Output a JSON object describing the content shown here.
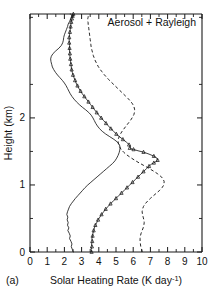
{
  "figure": {
    "panel_label": "(a)",
    "annotation": "Aerosol + Rayleigh"
  },
  "chart_data": {
    "type": "line",
    "title": "",
    "annotation": "Aerosol + Rayleigh",
    "panel_label": "(a)",
    "xlabel": "Solar Heating Rate (K day⁻¹)",
    "ylabel": "Height (km)",
    "xlim": [
      0,
      10
    ],
    "ylim": [
      0,
      3.55
    ],
    "grid": false,
    "legend_position": "none",
    "x_major_ticks": [
      0,
      1,
      2,
      3,
      4,
      5,
      6,
      7,
      8,
      9,
      10
    ],
    "x_major_tick_labels": [
      "0",
      "1",
      "2",
      "3",
      "4",
      "5",
      "6",
      "7",
      "8",
      "9",
      "10"
    ],
    "x_minor_tick_step": 0.5,
    "y_major_ticks": [
      0,
      1,
      2
    ],
    "y_major_tick_labels": [
      "0",
      "1",
      "2"
    ],
    "y_minor_tick_step": 0.5,
    "series": [
      {
        "name": "solid-thin",
        "style": "solid",
        "marker": "none",
        "x": [
          2.52,
          2.46,
          2.4,
          2.44,
          2.38,
          2.3,
          2.34,
          2.28,
          2.2,
          2.26,
          2.18,
          2.22,
          2.16,
          2.2,
          2.14,
          2.18,
          2.24,
          2.3,
          2.4,
          2.52,
          2.64,
          2.78,
          2.92,
          3.06,
          3.2,
          3.36,
          3.54,
          3.72,
          3.9,
          4.08,
          4.26,
          4.44,
          4.62,
          4.8,
          4.94,
          5.04,
          5.12,
          5.18,
          5.22,
          5.24,
          5.2,
          5.08,
          4.88,
          4.64,
          4.4,
          4.2,
          4.04,
          3.92,
          3.82,
          3.74,
          3.66,
          3.56,
          3.42,
          3.24,
          3.04,
          2.86,
          2.7,
          2.56,
          2.44,
          2.34,
          2.26,
          2.18,
          2.1,
          2.0,
          1.88,
          1.74,
          1.6,
          1.48,
          1.38,
          1.3,
          1.26,
          1.22,
          1.2,
          1.24,
          1.34,
          1.5,
          1.68,
          1.82,
          1.9,
          1.94,
          1.96,
          2.0,
          2.06,
          2.12,
          2.18,
          2.22,
          2.26,
          2.3,
          2.34,
          2.36,
          2.38,
          2.4,
          2.42,
          2.44,
          2.42,
          2.4,
          2.38,
          2.36,
          2.34
        ],
        "y": [
          0.0,
          0.04,
          0.08,
          0.12,
          0.16,
          0.2,
          0.24,
          0.28,
          0.32,
          0.36,
          0.4,
          0.44,
          0.48,
          0.52,
          0.56,
          0.6,
          0.64,
          0.68,
          0.72,
          0.76,
          0.8,
          0.84,
          0.88,
          0.92,
          0.96,
          1.0,
          1.04,
          1.08,
          1.12,
          1.16,
          1.2,
          1.24,
          1.28,
          1.32,
          1.36,
          1.4,
          1.44,
          1.48,
          1.52,
          1.56,
          1.6,
          1.64,
          1.68,
          1.72,
          1.76,
          1.8,
          1.84,
          1.88,
          1.92,
          1.96,
          2.0,
          2.04,
          2.08,
          2.12,
          2.16,
          2.2,
          2.24,
          2.28,
          2.32,
          2.36,
          2.4,
          2.44,
          2.48,
          2.52,
          2.56,
          2.6,
          2.64,
          2.68,
          2.72,
          2.76,
          2.8,
          2.84,
          2.88,
          2.92,
          2.96,
          3.0,
          3.04,
          3.08,
          3.12,
          3.16,
          3.2,
          3.24,
          3.28,
          3.32,
          3.36,
          3.4,
          3.42,
          3.44,
          3.46,
          3.48,
          3.49,
          3.5,
          3.51,
          3.52,
          3.53,
          3.54,
          3.545,
          3.55,
          3.55
        ]
      },
      {
        "name": "triangle-marked",
        "style": "solid",
        "marker": "triangle",
        "x": [
          3.58,
          3.56,
          3.6,
          3.58,
          3.62,
          3.6,
          3.64,
          3.66,
          3.7,
          3.74,
          3.8,
          3.88,
          3.96,
          4.06,
          4.16,
          4.28,
          4.4,
          4.54,
          4.68,
          4.84,
          5.0,
          5.16,
          5.32,
          5.48,
          5.64,
          5.8,
          5.96,
          6.12,
          6.28,
          6.44,
          6.6,
          6.76,
          6.92,
          7.06,
          7.2,
          7.34,
          7.42,
          7.38,
          7.2,
          6.92,
          6.6,
          6.28,
          6.02,
          5.86,
          5.8,
          5.84,
          5.76,
          5.6,
          5.4,
          5.2,
          5.02,
          4.86,
          4.7,
          4.56,
          4.42,
          4.28,
          4.14,
          4.0,
          3.88,
          3.76,
          3.64,
          3.52,
          3.4,
          3.28,
          3.16,
          3.04,
          2.94,
          2.84,
          2.76,
          2.68,
          2.62,
          2.56,
          2.5,
          2.46,
          2.42,
          2.4,
          2.38,
          2.36,
          2.34,
          2.32,
          2.32,
          2.3,
          2.3,
          2.3,
          2.28,
          2.28,
          2.28,
          2.3,
          2.32,
          2.34,
          2.36,
          2.38,
          2.4,
          2.42,
          2.44,
          2.46,
          2.48,
          2.5,
          2.52
        ],
        "y": [
          0.0,
          0.04,
          0.08,
          0.12,
          0.16,
          0.2,
          0.24,
          0.28,
          0.32,
          0.36,
          0.4,
          0.44,
          0.48,
          0.52,
          0.56,
          0.6,
          0.64,
          0.68,
          0.72,
          0.76,
          0.8,
          0.84,
          0.88,
          0.92,
          0.96,
          1.0,
          1.04,
          1.08,
          1.12,
          1.16,
          1.2,
          1.24,
          1.28,
          1.31,
          1.33,
          1.35,
          1.37,
          1.4,
          1.43,
          1.46,
          1.49,
          1.51,
          1.53,
          1.54,
          1.55,
          1.57,
          1.6,
          1.64,
          1.68,
          1.72,
          1.76,
          1.8,
          1.84,
          1.88,
          1.92,
          1.96,
          2.0,
          2.04,
          2.08,
          2.12,
          2.16,
          2.2,
          2.24,
          2.28,
          2.32,
          2.36,
          2.4,
          2.44,
          2.48,
          2.52,
          2.56,
          2.6,
          2.64,
          2.68,
          2.72,
          2.76,
          2.8,
          2.84,
          2.88,
          2.92,
          2.96,
          3.0,
          3.04,
          3.08,
          3.12,
          3.16,
          3.2,
          3.24,
          3.28,
          3.32,
          3.36,
          3.4,
          3.43,
          3.46,
          3.48,
          3.5,
          3.52,
          3.54,
          3.55
        ]
      },
      {
        "name": "dashed",
        "style": "dashed",
        "marker": "none",
        "x": [
          6.52,
          6.48,
          6.44,
          6.42,
          6.4,
          6.4,
          6.42,
          6.46,
          6.52,
          6.58,
          6.62,
          6.64,
          6.62,
          6.58,
          6.54,
          6.52,
          6.54,
          6.6,
          6.7,
          6.84,
          7.0,
          7.18,
          7.36,
          7.54,
          7.68,
          7.78,
          7.8,
          7.74,
          7.6,
          7.4,
          7.16,
          6.9,
          6.62,
          6.34,
          6.08,
          5.84,
          5.62,
          5.44,
          5.3,
          5.2,
          5.14,
          5.12,
          5.14,
          5.2,
          5.28,
          5.38,
          5.5,
          5.62,
          5.74,
          5.86,
          5.96,
          6.04,
          6.08,
          6.08,
          6.04,
          5.96,
          5.84,
          5.7,
          5.54,
          5.38,
          5.22,
          5.06,
          4.9,
          4.74,
          4.58,
          4.44,
          4.3,
          4.18,
          4.06,
          3.96,
          3.88,
          3.8,
          3.74,
          3.68,
          3.64,
          3.6,
          3.56,
          3.54,
          3.52,
          3.5,
          3.48,
          3.46,
          3.44,
          3.42,
          3.4,
          3.38,
          3.38,
          3.36,
          3.36,
          3.36,
          3.36,
          3.36,
          3.38,
          3.38,
          3.4,
          3.4,
          3.42,
          3.42,
          3.44
        ],
        "y": [
          0.0,
          0.04,
          0.08,
          0.12,
          0.16,
          0.2,
          0.24,
          0.28,
          0.32,
          0.36,
          0.4,
          0.44,
          0.48,
          0.52,
          0.56,
          0.6,
          0.64,
          0.68,
          0.72,
          0.76,
          0.8,
          0.84,
          0.88,
          0.92,
          0.96,
          1.0,
          1.05,
          1.09,
          1.13,
          1.17,
          1.21,
          1.25,
          1.29,
          1.33,
          1.37,
          1.41,
          1.45,
          1.49,
          1.53,
          1.57,
          1.61,
          1.65,
          1.69,
          1.73,
          1.77,
          1.81,
          1.85,
          1.89,
          1.93,
          1.97,
          2.01,
          2.05,
          2.09,
          2.13,
          2.17,
          2.21,
          2.25,
          2.29,
          2.33,
          2.37,
          2.41,
          2.45,
          2.49,
          2.53,
          2.57,
          2.61,
          2.65,
          2.69,
          2.73,
          2.77,
          2.81,
          2.85,
          2.89,
          2.93,
          2.97,
          3.01,
          3.05,
          3.09,
          3.13,
          3.17,
          3.21,
          3.25,
          3.29,
          3.33,
          3.37,
          3.4,
          3.42,
          3.44,
          3.46,
          3.47,
          3.48,
          3.49,
          3.5,
          3.51,
          3.52,
          3.53,
          3.54,
          3.545,
          3.55
        ]
      }
    ]
  }
}
